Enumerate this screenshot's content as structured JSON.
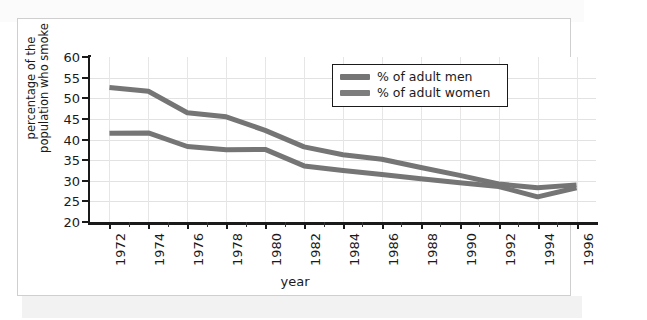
{
  "chart_data": {
    "type": "line",
    "title": "",
    "xlabel": "year",
    "ylabel": "percentage of the population who smoke",
    "ylabel_line1": "percentage of the",
    "ylabel_line2": "population who smoke",
    "x": [
      1972,
      1974,
      1976,
      1978,
      1980,
      1982,
      1984,
      1986,
      1988,
      1990,
      1992,
      1994,
      1996
    ],
    "categories": [
      "1972",
      "1974",
      "1976",
      "1978",
      "1980",
      "1982",
      "1984",
      "1986",
      "1988",
      "1990",
      "1992",
      "1994",
      "1996"
    ],
    "xlim": [
      1971,
      1997
    ],
    "ylim": [
      20,
      60
    ],
    "yticks": [
      20,
      25,
      30,
      35,
      40,
      45,
      50,
      55,
      60
    ],
    "ytick_labels": [
      "20",
      "25",
      "30",
      "35",
      "40",
      "45",
      "50",
      "55",
      "60"
    ],
    "grid": true,
    "legend_position": "upper-right",
    "series": [
      {
        "name": "% of adult men",
        "color": "#757575",
        "values": [
          52.6,
          51.7,
          46.5,
          45.5,
          42.2,
          38.2,
          36.3,
          35.2,
          33.2,
          31.3,
          29.2,
          28.3,
          29.0
        ]
      },
      {
        "name": "% of adult women",
        "color": "#757575",
        "values": [
          41.5,
          41.6,
          38.3,
          37.5,
          37.6,
          33.6,
          32.5,
          31.5,
          30.5,
          29.5,
          28.6,
          26.1,
          28.3
        ]
      }
    ]
  },
  "legend": {
    "items": [
      {
        "label": "% of adult men",
        "swatch_color": "#757575"
      },
      {
        "label": "% of adult women",
        "swatch_color": "#7d7d7d"
      }
    ]
  },
  "axes": {
    "x_title": "year",
    "y_title_line1": "percentage of the",
    "y_title_line2": "population who smoke"
  },
  "colors": {
    "line": "#757575",
    "axis": "#1a1a1a",
    "grid": "#e2e2e2",
    "card_border": "#cfcfcf",
    "background": "#ffffff"
  }
}
